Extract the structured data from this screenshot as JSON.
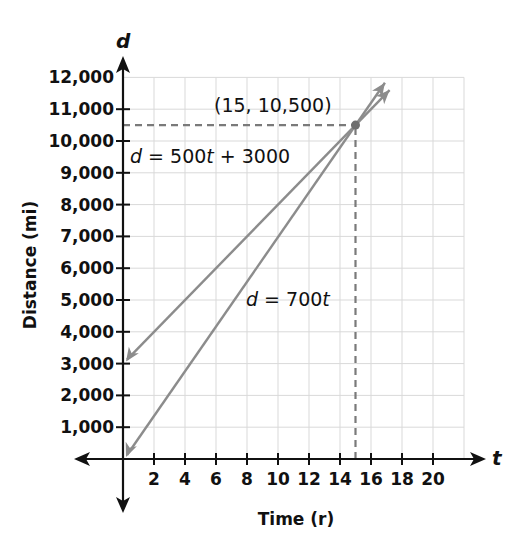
{
  "chart_data": {
    "type": "line",
    "title": "",
    "xlabel": "Time (r)",
    "ylabel": "Distance (mi)",
    "x_axis_var": "t",
    "y_axis_var": "d",
    "xlim": [
      0,
      22
    ],
    "ylim": [
      0,
      12000
    ],
    "grid": true,
    "x_ticks": [
      2,
      4,
      6,
      8,
      10,
      12,
      14,
      16,
      18,
      20
    ],
    "x_tick_labels": [
      "2",
      "4",
      "6",
      "8",
      "10",
      "12",
      "14",
      "16",
      "18",
      "20"
    ],
    "y_ticks": [
      1000,
      2000,
      3000,
      4000,
      5000,
      6000,
      7000,
      8000,
      9000,
      10000,
      11000,
      12000
    ],
    "y_tick_labels": [
      "1,000",
      "2,000",
      "3,000",
      "4,000",
      "5,000",
      "6,000",
      "7,000",
      "8,000",
      "9,000",
      "10,000",
      "11,000",
      "12,000"
    ],
    "series": [
      {
        "name": "d = 500t + 3000",
        "equation": "d = 500t + 3000",
        "x": [
          0,
          15,
          17.2
        ],
        "y": [
          3000,
          10500,
          11600
        ]
      },
      {
        "name": "d = 700t",
        "equation": "d = 700t",
        "x": [
          0,
          15,
          16.9
        ],
        "y": [
          0,
          10500,
          11830
        ]
      }
    ],
    "annotations": [
      {
        "text": "(15, 10,500)",
        "x": 15,
        "y": 10500,
        "type": "intersection-point"
      },
      {
        "text": "d = 500t + 3000",
        "target": "series-0"
      },
      {
        "text": "d = 700t",
        "target": "series-1"
      }
    ],
    "dashed_guides": [
      {
        "from": [
          0,
          10500
        ],
        "to": [
          15,
          10500
        ]
      },
      {
        "from": [
          15,
          0
        ],
        "to": [
          15,
          10500
        ]
      }
    ],
    "colors": {
      "lines": "#8c8c8c",
      "grid": "#d9d9d9",
      "axes": "#111111",
      "point": "#6e6e6e"
    }
  },
  "labels": {
    "y_var": "d",
    "x_var": "t",
    "ylabel": "Distance (mi)",
    "xlabel": "Time (r)",
    "point": "(15, 10,500)",
    "eq1_d": "d",
    "eq1_rest1": " = 500",
    "eq1_t": "t",
    "eq1_rest2": " + 3000",
    "eq2_d": "d",
    "eq2_rest": " = 700",
    "eq2_t": "t"
  }
}
